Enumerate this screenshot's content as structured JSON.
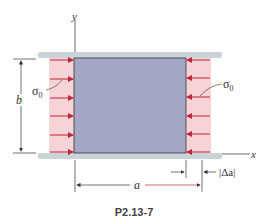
{
  "figure": {
    "caption": "P2.13-7",
    "axes": {
      "x_label": "x",
      "y_label": "y"
    },
    "dimensions": {
      "height_label": "b",
      "width_label": "a",
      "change_label": "|Δa|"
    },
    "stress": {
      "left_label": "σ",
      "left_sub": "0",
      "right_label": "σ",
      "right_sub": "0",
      "arrow_rows": 6
    },
    "colors": {
      "block": "#a3a6c4",
      "stress_region": "#f6d3d7",
      "arrow": "#c0263a",
      "plate": "#c9d3d8",
      "line": "#222222"
    }
  }
}
